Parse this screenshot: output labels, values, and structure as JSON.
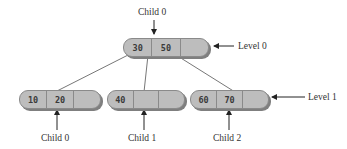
{
  "tree": {
    "root": {
      "keys": [
        "30",
        "50",
        ""
      ],
      "label_above": "Child 0",
      "level_label": "Level 0"
    },
    "children": [
      {
        "keys": [
          "10",
          "20",
          ""
        ],
        "label": "Child 0"
      },
      {
        "keys": [
          "40",
          "",
          ""
        ],
        "label": "Child 1"
      },
      {
        "keys": [
          "60",
          "70",
          ""
        ],
        "label": "Child 2"
      }
    ],
    "level1_label": "Level 1"
  },
  "colors": {
    "node_fill": "#bdbdbd",
    "node_border": "#8a8a8a",
    "shadow": "#7f7f7f",
    "line": "#666666"
  }
}
